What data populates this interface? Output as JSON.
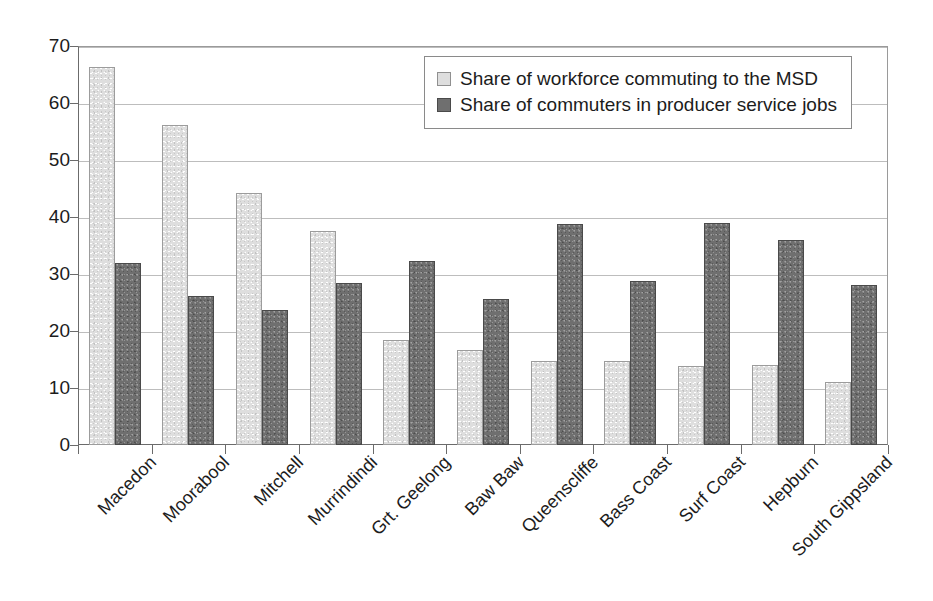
{
  "chart_data": {
    "type": "bar",
    "title": "",
    "subtitle": "",
    "xlabel": "",
    "ylabel": "",
    "ylim": [
      0,
      70
    ],
    "ytick_step": 10,
    "yticks": [
      0,
      10,
      20,
      30,
      40,
      50,
      60,
      70
    ],
    "ytick_labels": [
      "0",
      "10",
      "20",
      "30",
      "40",
      "50",
      "60",
      "70"
    ],
    "grid": true,
    "grid_axis": "y",
    "legend_position": "top-right-inside",
    "orientation": "vertical",
    "bar_mode": "grouped",
    "categories": [
      "Macedon",
      "Moorabool",
      "Mitchell",
      "Murrindindi",
      "Grt. Geelong",
      "Baw Baw",
      "Queenscliffe",
      "Bass Coast",
      "Surf Coast",
      "Hepburn",
      "South Gippsland"
    ],
    "series": [
      {
        "name": "Share of workforce commuting to the MSD",
        "color": "#dedede",
        "values": [
          66.3,
          56.1,
          44.3,
          37.6,
          18.5,
          16.7,
          14.7,
          14.8,
          13.8,
          14.0,
          11.0
        ]
      },
      {
        "name": "Share of commuters in producer service jobs",
        "color": "#6f6f6f",
        "values": [
          32.0,
          26.1,
          23.6,
          28.4,
          32.3,
          25.6,
          38.8,
          28.8,
          39.0,
          35.9,
          28.1
        ]
      }
    ],
    "colors": {
      "series_light": "#dedede",
      "series_dark": "#6f6f6f",
      "axis": "#6b6b6b",
      "gridline": "#bdbdbd",
      "text": "#1c1c1c",
      "background": "#ffffff"
    }
  },
  "legend": {
    "entries": [
      {
        "label": "Share of workforce commuting to the MSD",
        "swatch": "light-gray-swatch"
      },
      {
        "label": "Share of commuters in producer service jobs",
        "swatch": "dark-gray-swatch"
      }
    ]
  }
}
